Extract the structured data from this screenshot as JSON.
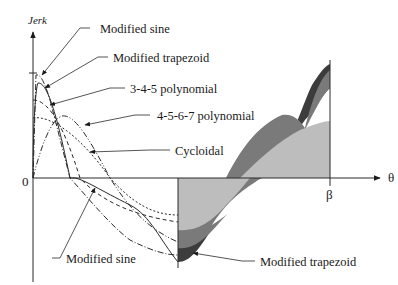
{
  "diagram": {
    "y_axis_label": "Jerk",
    "x_axis_label": "θ",
    "origin_label": "0",
    "end_label": "β",
    "callouts": {
      "modified_sine_top": "Modified sine",
      "modified_trapezoid_top": "Modified trapezoid",
      "poly_345": "3-4-5 polynomial",
      "poly_4567": "4-5-6-7 polynomial",
      "cycloidal": "Cycloidal",
      "modified_sine_bottom": "Modified sine",
      "modified_trapezoid_bottom": "Modified trapezoid"
    },
    "colors": {
      "line": "#2a2a2a",
      "fill_light": "#bdbdbd",
      "fill_mid": "#7a7a7a",
      "fill_dark": "#3c3c3c",
      "background": "#ffffff"
    }
  }
}
